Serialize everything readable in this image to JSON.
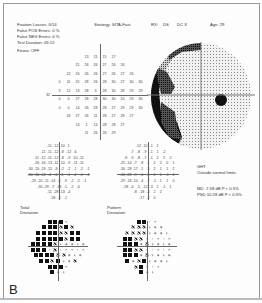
{
  "header": {
    "fixation_losses": "Fixation Losses: 0/14",
    "false_pos": "False POS Errors:   0 %",
    "false_neg": "False NEG Errors:   0 %",
    "test_duration": "Test Duration: 05:12",
    "fovea": "Fovea: OFF",
    "strategy": "Strategy: SITA-Fast",
    "rx": "RX:",
    "ds": "DS",
    "dc": "DC X",
    "age": "Age: 29"
  },
  "threshold_grid": {
    "rows": [
      [
        "13",
        "15",
        "15",
        "17"
      ],
      [
        "21",
        "26",
        "26",
        "27",
        "26",
        "26"
      ],
      [
        "22",
        "26",
        "26",
        "26",
        "27",
        "26",
        "27",
        "26"
      ],
      [
        "0",
        "11",
        "25",
        "28",
        "26",
        "28",
        "30",
        "27",
        "30",
        "30"
      ],
      [
        "3",
        "12",
        "13",
        "28",
        "3",
        "28",
        "30",
        "28",
        "29",
        "29"
      ],
      [
        "0",
        "0",
        "27",
        "28",
        "28",
        "30",
        "30",
        "10",
        "29",
        "30"
      ],
      [
        "0",
        "0",
        "14",
        "26",
        "28",
        "28",
        "27",
        "29",
        "29",
        "30"
      ],
      [
        "26",
        "27",
        "26",
        "11",
        "28",
        "27",
        "28",
        "27"
      ],
      [
        "14",
        "1",
        "14",
        "28",
        "28",
        "27"
      ],
      [
        "11",
        "26",
        "26",
        "29"
      ]
    ],
    "left_marker": "32"
  },
  "total_deviation": {
    "label_line1": "Total",
    "label_line2": "Deviation",
    "rows": [
      [
        "-11",
        "-12",
        "-10",
        "1"
      ],
      [
        "-11",
        "-11",
        "-12",
        "-8",
        "-12",
        "-6"
      ],
      [
        "-11",
        "-12",
        "-11",
        "-12",
        "-8",
        "-9",
        "-10",
        "-11"
      ],
      [
        "-26",
        "-16",
        "-13",
        "-11",
        "-10",
        "-9",
        "-11",
        "-11"
      ],
      [
        "-30",
        "-20",
        "-19",
        "-15",
        "-8",
        "-2",
        "-2",
        "-1",
        "-2",
        "-1"
      ],
      [
        "-30",
        "-30",
        "-14",
        "-4",
        "-6",
        "0",
        "-1",
        "-2",
        "-1",
        "-1"
      ],
      [
        "-29",
        "-20",
        "-11",
        "-14",
        "-8",
        "-9",
        "-2",
        "-2",
        "-1"
      ],
      [
        "-30",
        "-29",
        "-7",
        "-19",
        "-1",
        "-2",
        "-6"
      ],
      [
        "-11",
        "-28",
        "-13",
        "-4"
      ],
      [
        "-18",
        "-3",
        "-1"
      ]
    ]
  },
  "pattern_deviation": {
    "label_line1": "Pattern",
    "label_line2": "Deviation",
    "rows": [
      [
        "-12",
        "-10",
        "-1",
        "2"
      ],
      [
        "-7",
        "-8",
        "-9",
        "-1",
        "1",
        "-2"
      ],
      [
        "-8",
        "-9",
        "-8",
        "-7",
        "-1",
        "2",
        "2",
        "2"
      ],
      [
        "-25",
        "-14",
        "-7",
        "-8",
        "-1",
        "2",
        "2",
        "0",
        "1"
      ],
      [
        "-30",
        "-28",
        "-17",
        "-1",
        "-5",
        "2",
        "1",
        "1",
        "2"
      ],
      [
        "-30",
        "-28",
        "-9",
        "-6",
        "-3",
        "2",
        "1",
        "-1",
        "2"
      ],
      [
        "-29",
        "-18",
        "-10",
        "-4",
        "-7",
        "-1",
        "1",
        "1",
        "0"
      ],
      [
        "-28",
        "-4",
        "-5",
        "-12",
        "-3",
        "2",
        "-1",
        "1"
      ],
      [
        "-8",
        "-18",
        "-4",
        "2",
        "2"
      ],
      [
        "-17",
        "-2",
        "0"
      ]
    ]
  },
  "ght": {
    "title": "GHT",
    "result": "Outside normal limits"
  },
  "indices": {
    "md": "MD    -7.58 dB P < 0.5%",
    "psd": "PSD   10.28 dB P < 0.5%"
  },
  "figure_label": "B"
}
